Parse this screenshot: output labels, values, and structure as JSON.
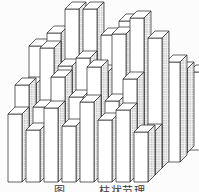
{
  "figure": {
    "caption": {
      "prefix": "图",
      "title": "柱状节理"
    },
    "style": {
      "stroke": "#1f1f1f",
      "face": "#ffffff",
      "top": "#ffffff",
      "stipple_dot": "#707070",
      "stipple_bg": "#f3f3f3",
      "background": "#fcfcfc"
    },
    "projection": {
      "pillar_width": 14,
      "skew_x": 7,
      "skew_y": 7
    },
    "pillars": [
      {
        "x": 189,
        "b": 150,
        "h": 78
      },
      {
        "x": 173,
        "b": 153,
        "h": 84
      },
      {
        "x": 29,
        "b": 161,
        "h": 115
      },
      {
        "x": 47,
        "b": 161,
        "h": 128
      },
      {
        "x": 65,
        "b": 161,
        "h": 152
      },
      {
        "x": 83,
        "b": 161,
        "h": 152
      },
      {
        "x": 101,
        "b": 161,
        "h": 126
      },
      {
        "x": 119,
        "b": 161,
        "h": 140
      },
      {
        "x": 137,
        "b": 161,
        "h": 118
      },
      {
        "x": 166,
        "b": 162,
        "h": 100
      },
      {
        "x": 22,
        "b": 168,
        "h": 84
      },
      {
        "x": 40,
        "b": 168,
        "h": 120
      },
      {
        "x": 58,
        "b": 168,
        "h": 102
      },
      {
        "x": 76,
        "b": 168,
        "h": 110
      },
      {
        "x": 94,
        "b": 168,
        "h": 96
      },
      {
        "x": 112,
        "b": 168,
        "h": 134
      },
      {
        "x": 130,
        "b": 168,
        "h": 150
      },
      {
        "x": 148,
        "b": 168,
        "h": 130
      },
      {
        "x": 15,
        "b": 175,
        "h": 90
      },
      {
        "x": 33,
        "b": 175,
        "h": 68
      },
      {
        "x": 51,
        "b": 175,
        "h": 98
      },
      {
        "x": 69,
        "b": 175,
        "h": 78
      },
      {
        "x": 87,
        "b": 175,
        "h": 108
      },
      {
        "x": 105,
        "b": 175,
        "h": 74
      },
      {
        "x": 123,
        "b": 175,
        "h": 96
      },
      {
        "x": 141,
        "b": 175,
        "h": 44
      },
      {
        "x": 8,
        "b": 182,
        "h": 68
      },
      {
        "x": 26,
        "b": 182,
        "h": 52
      },
      {
        "x": 44,
        "b": 182,
        "h": 74
      },
      {
        "x": 62,
        "b": 182,
        "h": 56
      },
      {
        "x": 80,
        "b": 182,
        "h": 80
      },
      {
        "x": 98,
        "b": 182,
        "h": 62
      },
      {
        "x": 116,
        "b": 182,
        "h": 72
      },
      {
        "x": 134,
        "b": 182,
        "h": 50
      }
    ]
  }
}
